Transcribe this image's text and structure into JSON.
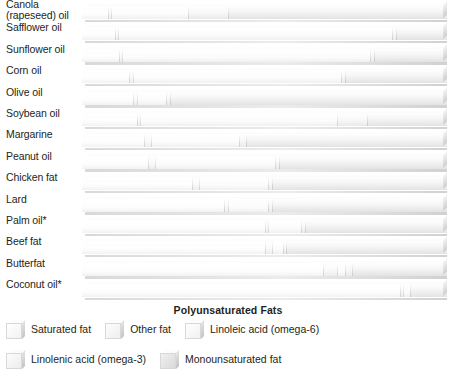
{
  "chart_data": {
    "type": "bar",
    "orientation": "horizontal",
    "stacked": true,
    "normalized": "100%",
    "title": "",
    "xlabel": "",
    "ylabel": "",
    "xlim": [
      0,
      100
    ],
    "grid": false,
    "legend_position": "bottom",
    "group_label": "Polyunsaturated Fats",
    "footnote_marker": "*",
    "series": [
      {
        "name": "Saturated fat",
        "key": "sat",
        "color": "#fdfdfd",
        "values": [
          7,
          9,
          10,
          13,
          14,
          15,
          17,
          18,
          30,
          39,
          50,
          50,
          66,
          87
        ]
      },
      {
        "name": "Other fat",
        "key": "other",
        "color": "#f7f7f7",
        "values": [
          1,
          1,
          1,
          1,
          1,
          1,
          2,
          2,
          2,
          1,
          1,
          2,
          4,
          1
        ]
      },
      {
        "name": "Linoleic acid (omega-6)",
        "key": "la",
        "color": "#fbfbfb",
        "values": [
          21,
          75,
          68,
          57,
          8,
          54,
          24,
          33,
          19,
          11,
          9,
          3,
          2,
          2
        ]
      },
      {
        "name": "Linolenic acid (omega-3)",
        "key": "ala",
        "color": "#f4f4f4",
        "values": [
          11,
          1,
          1,
          1,
          1,
          8,
          2,
          1,
          1,
          1,
          1,
          1,
          2,
          0
        ]
      },
      {
        "name": "Monounsaturated fat",
        "key": "mufa",
        "color": "#ededed",
        "values": [
          60,
          14,
          20,
          28,
          76,
          22,
          55,
          46,
          48,
          48,
          39,
          44,
          26,
          10
        ]
      }
    ],
    "categories": [
      "Canola\n(rapeseed) oil",
      "Safflower oil",
      "Sunflower oil",
      "Corn oil",
      "Olive oil",
      "Soybean oil",
      "Margarine",
      "Peanut oil",
      "Chicken fat",
      "Lard",
      "Palm oil*",
      "Beef fat",
      "Butterfat",
      "Coconut oil*"
    ]
  },
  "legend": {
    "rows": [
      [
        {
          "label": "Saturated fat",
          "key": "sat",
          "swatch": "legend-swatch-saturated-fat"
        },
        {
          "label": "Other fat",
          "key": "other",
          "swatch": "legend-swatch-other-fat"
        },
        {
          "label": "Linoleic acid (omega-6)",
          "key": "la",
          "swatch": "legend-swatch-linoleic-acid"
        }
      ],
      [
        {
          "label": "Linolenic acid (omega-3)",
          "key": "ala",
          "swatch": "legend-swatch-linolenic-acid"
        },
        {
          "label": "Monounsaturated fat",
          "key": "mufa",
          "swatch": "legend-swatch-monounsaturated-fat"
        }
      ]
    ]
  },
  "poly_bracket": {
    "label": "Polyunsaturated Fats"
  }
}
